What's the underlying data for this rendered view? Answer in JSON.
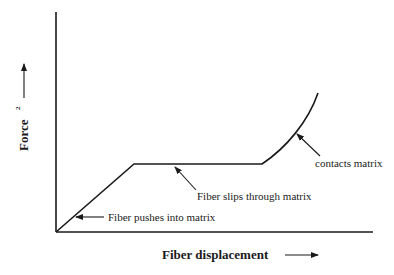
{
  "diagram": {
    "colors": {
      "background": "#ffffff",
      "ink": "#1a1a1a"
    },
    "axes": {
      "x_label": "Fiber displacement",
      "y_label": "Force",
      "y_label_superscript": "2",
      "x_arrow": "arrow-right",
      "y_arrow": "arrow-up"
    },
    "curve": {
      "segments": [
        {
          "name": "linear-rise",
          "description": "straight line from origin"
        },
        {
          "name": "plateau",
          "description": "horizontal constant force"
        },
        {
          "name": "upturn",
          "description": "curve rising steeply"
        }
      ]
    },
    "annotations": [
      {
        "id": "pushes",
        "text": "Fiber pushes into matrix"
      },
      {
        "id": "slips",
        "text": "Fiber slips through matrix"
      },
      {
        "id": "contacts",
        "text": "contacts matrix"
      }
    ]
  }
}
